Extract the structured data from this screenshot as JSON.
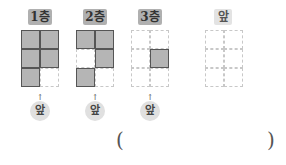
{
  "floors": [
    {
      "label": "1층",
      "cells": [
        1,
        1,
        1,
        1,
        1,
        0
      ],
      "front": "앞"
    },
    {
      "label": "2층",
      "cells": [
        1,
        1,
        0,
        1,
        1,
        0
      ],
      "front": "앞"
    },
    {
      "label": "3층",
      "cells": [
        0,
        0,
        0,
        1,
        0,
        0
      ],
      "front": "앞"
    }
  ],
  "answer_view": {
    "label": "앞",
    "cells": [
      0,
      0,
      0,
      0,
      0,
      0
    ]
  },
  "answer": {
    "open": "(",
    "close": ")"
  },
  "arrow": "↑"
}
